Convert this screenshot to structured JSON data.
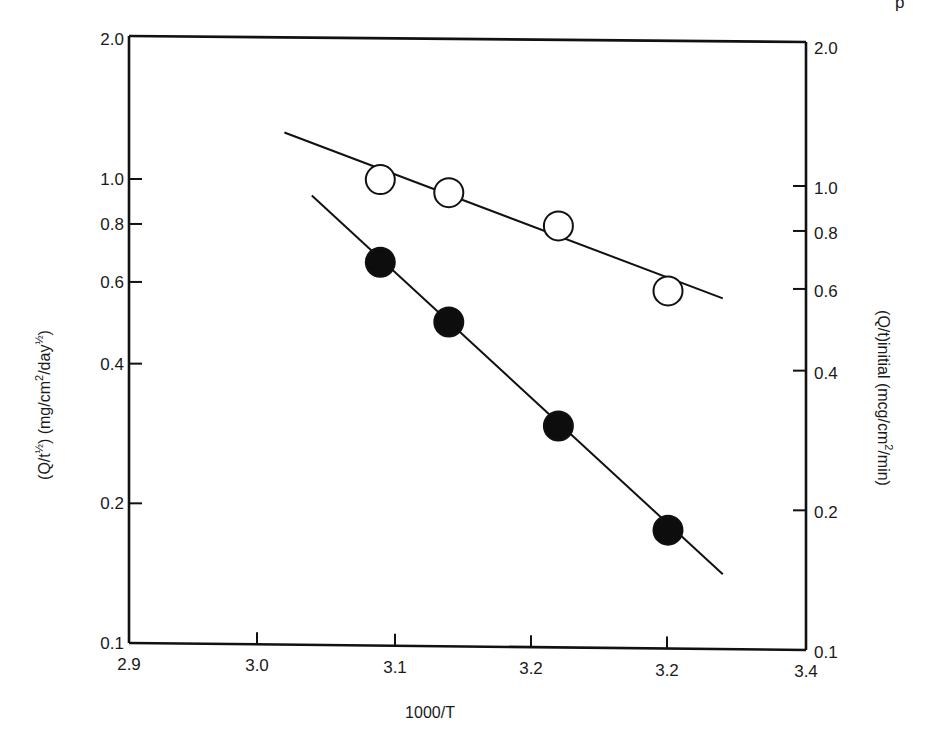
{
  "page_fragment": {
    "glyph": "p"
  },
  "chart_data": {
    "type": "scatter",
    "title": "",
    "xlabel": "1000/T",
    "ylabel_left": "(Q/t½) (mg/cm²/day½)",
    "ylabel_right": "(Q/t)initial (mcg/cm²/min)",
    "x_ticks": [
      "2.9",
      "3.0",
      "3.1",
      "3.2",
      "3.2",
      "3.4"
    ],
    "x_tick_values": [
      2.9,
      3.0,
      3.1,
      3.2,
      3.3,
      3.4
    ],
    "y_scale": "log",
    "ylim": [
      0.1,
      2.0
    ],
    "xlim": [
      2.9,
      3.4
    ],
    "y_ticks_left": [
      "2.0",
      "1.0",
      "0.8",
      "0.6",
      "0.4",
      "0.2",
      "0.1"
    ],
    "y_ticks_right": [
      "2.0",
      "1.0",
      "0.8",
      "0.6",
      "0.4",
      "0.2",
      "0.1"
    ],
    "y_tick_values": [
      2.0,
      1.0,
      0.8,
      0.6,
      0.4,
      0.2,
      0.1
    ],
    "grid": false,
    "legend": null,
    "series": [
      {
        "name": "open circles",
        "marker": "open-circle",
        "axis": "right",
        "x": [
          3.09,
          3.14,
          3.22,
          3.3
        ],
        "values": [
          1.01,
          0.95,
          0.81,
          0.59
        ],
        "fit_line": {
          "x": [
            3.02,
            3.34
          ],
          "y": [
            1.27,
            0.57
          ]
        }
      },
      {
        "name": "filled circles",
        "marker": "filled-circle",
        "axis": "left",
        "x": [
          3.09,
          3.14,
          3.22,
          3.3
        ],
        "values": [
          0.67,
          0.5,
          0.3,
          0.18
        ],
        "fit_line": {
          "x": [
            3.04,
            3.34
          ],
          "y": [
            0.93,
            0.145
          ]
        }
      }
    ]
  }
}
